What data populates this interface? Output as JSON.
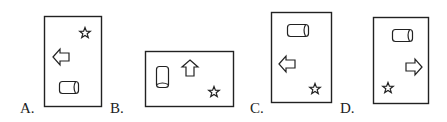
{
  "options": [
    {
      "label": "A.",
      "orientation": "portrait",
      "shapes": {
        "star": "top-right",
        "arrow": "middle-left",
        "arrow_direction": "left",
        "cylinder": "bottom-center",
        "cylinder_orientation": "horizontal"
      }
    },
    {
      "label": "B.",
      "orientation": "landscape",
      "shapes": {
        "star": "bottom-right",
        "arrow": "top-center",
        "arrow_direction": "up",
        "cylinder": "middle-left",
        "cylinder_orientation": "vertical"
      }
    },
    {
      "label": "C.",
      "orientation": "portrait",
      "shapes": {
        "star": "bottom-right",
        "arrow": "middle-left",
        "arrow_direction": "left",
        "cylinder": "top-center",
        "cylinder_orientation": "horizontal"
      }
    },
    {
      "label": "D.",
      "orientation": "portrait",
      "shapes": {
        "star": "bottom-left",
        "arrow": "middle-right",
        "arrow_direction": "right",
        "cylinder": "top-center",
        "cylinder_orientation": "horizontal"
      }
    }
  ],
  "colors": {
    "stroke": "#222222",
    "background": "#ffffff"
  }
}
